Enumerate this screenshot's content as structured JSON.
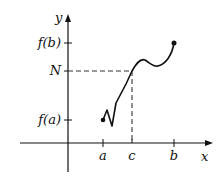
{
  "diagram": {
    "axes": {
      "x_label": "x",
      "y_label": "y"
    },
    "x_ticks": [
      {
        "label": "a",
        "x": 103
      },
      {
        "label": "c",
        "x": 132
      },
      {
        "label": "b",
        "x": 174
      }
    ],
    "y_ticks": [
      {
        "label": "f(b)",
        "y": 43
      },
      {
        "label": "N",
        "y": 71
      },
      {
        "label": "f(a)",
        "y": 120
      }
    ],
    "colors": {
      "stroke": "#111111",
      "dashed": "#333333"
    }
  }
}
